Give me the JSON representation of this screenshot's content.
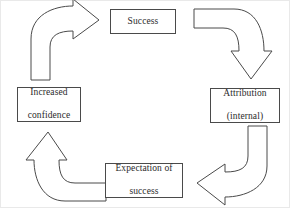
{
  "diagram": {
    "stroke_color": "#4a4a4a",
    "text_color": "#2b2b2b",
    "background_color": "#ffffff",
    "nodes": [
      {
        "id": "success",
        "label": "Success",
        "line1": "Success",
        "line2": ""
      },
      {
        "id": "attribution",
        "label": "Attribution (internal)",
        "line1": "Attribution",
        "line2": "(internal)"
      },
      {
        "id": "expectation",
        "label": "Expectation of success",
        "line1": "Expectation of",
        "line2": "success"
      },
      {
        "id": "confidence",
        "label": "Increased confidence",
        "line1": "Increased",
        "line2": "confidence"
      }
    ],
    "arrows": [
      {
        "id": "arrow-top-left",
        "name": "curved-arrow-up-right",
        "from": "Increased confidence",
        "to": "Success",
        "direction": "right"
      },
      {
        "id": "arrow-top-right",
        "name": "curved-arrow-right-down",
        "from": "Success",
        "to": "Attribution (internal)",
        "direction": "down"
      },
      {
        "id": "arrow-bottom-right",
        "name": "curved-arrow-down-left",
        "from": "Attribution (internal)",
        "to": "Expectation of success",
        "direction": "left"
      },
      {
        "id": "arrow-bottom-left",
        "name": "curved-arrow-left-up",
        "from": "Expectation of success",
        "to": "Increased confidence",
        "direction": "up"
      }
    ]
  }
}
